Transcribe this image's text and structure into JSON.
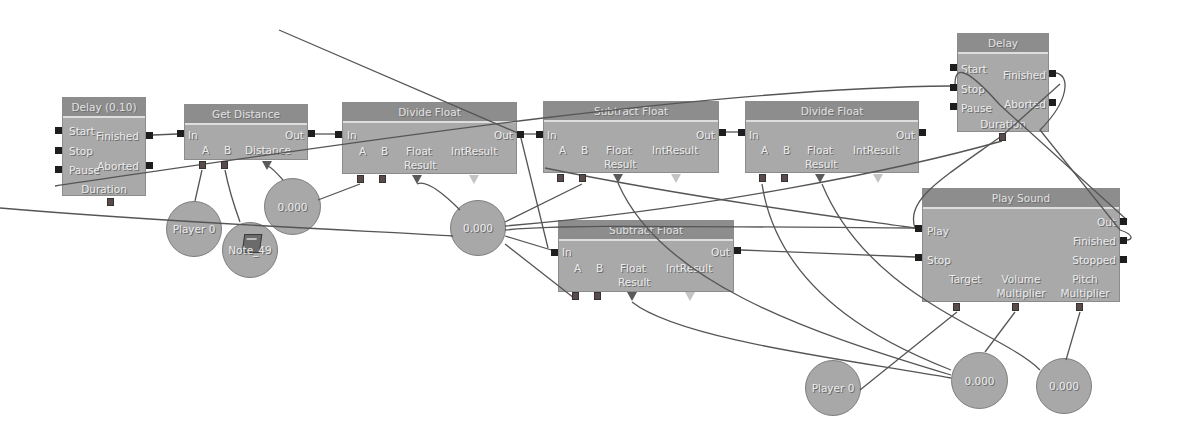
{
  "diagram": {
    "type": "Kismet visual script graph",
    "nodes": {
      "delay_010": {
        "title": "Delay (0.10)",
        "inputs": [
          "Start",
          "Stop",
          "Pause"
        ],
        "outputs": [
          "Finished",
          "Aborted"
        ],
        "variables": [
          "Duration"
        ]
      },
      "get_distance": {
        "title": "Get Distance",
        "inputs": [
          "In"
        ],
        "outputs": [
          "Out"
        ],
        "variables": [
          "A",
          "B",
          "Distance"
        ]
      },
      "divide_float_1": {
        "title": "Divide Float",
        "inputs": [
          "In"
        ],
        "outputs": [
          "Out"
        ],
        "variables": [
          "A",
          "B",
          "Float Result",
          "IntResult"
        ]
      },
      "subtract_float_1": {
        "title": "Subtract Float",
        "inputs": [
          "In"
        ],
        "outputs": [
          "Out"
        ],
        "variables": [
          "A",
          "B",
          "Float Result",
          "IntResult"
        ]
      },
      "divide_float_2": {
        "title": "Divide Float",
        "inputs": [
          "In"
        ],
        "outputs": [
          "Out"
        ],
        "variables": [
          "A",
          "B",
          "Float Result",
          "IntResult"
        ]
      },
      "delay": {
        "title": "Delay",
        "inputs": [
          "Start",
          "Stop",
          "Pause"
        ],
        "outputs": [
          "Finished",
          "Aborted"
        ],
        "variables": [
          "Duration"
        ]
      },
      "subtract_float_2": {
        "title": "Subtract Float",
        "inputs": [
          "In"
        ],
        "outputs": [
          "Out"
        ],
        "variables": [
          "A",
          "B",
          "Float Result",
          "IntResult"
        ]
      },
      "play_sound": {
        "title": "Play Sound",
        "inputs": [
          "Play",
          "Stop"
        ],
        "outputs": [
          "Out",
          "Finished",
          "Stopped"
        ],
        "variables": [
          "Target",
          "Volume Multiplier",
          "Pitch Multiplier"
        ]
      }
    },
    "variables": {
      "player0_a": "Player 0",
      "note49": "Note_49",
      "float_a": "0.000",
      "float_b": "0.000",
      "player0_b": "Player 0",
      "float_c": "0.000",
      "float_d": "0.000"
    }
  },
  "labels": {
    "float": "Float",
    "result": "Result",
    "volume": "Volume",
    "pitch": "Pitch",
    "multiplier": "Multiplier"
  }
}
